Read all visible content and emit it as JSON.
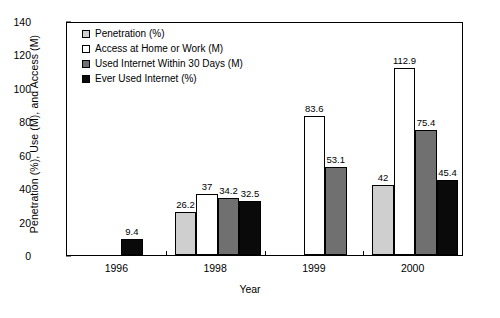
{
  "chart_data": {
    "type": "bar",
    "title": "",
    "xlabel": "Year",
    "ylabel": "Penetration (%), Use (M), and Access (M)",
    "categories": [
      "1996",
      "1998",
      "1999",
      "2000"
    ],
    "ylim": [
      0,
      140
    ],
    "yticks": [
      0,
      20,
      40,
      60,
      80,
      100,
      120,
      140
    ],
    "grid": false,
    "legend_position": "top-left",
    "series": [
      {
        "name": "Penetration (%)",
        "color": "#cfcfcf",
        "values": [
          null,
          26.2,
          null,
          42
        ],
        "labels": [
          "",
          "26.2",
          "",
          "42"
        ]
      },
      {
        "name": "Access at Home or Work (M)",
        "color": "#ffffff",
        "values": [
          null,
          37,
          83.6,
          112.9
        ],
        "labels": [
          "",
          "37",
          "83.6",
          "112.9"
        ]
      },
      {
        "name": "Used Internet Within 30 Days (M)",
        "color": "#707070",
        "values": [
          null,
          34.2,
          53.1,
          75.4
        ],
        "labels": [
          "",
          "34.2",
          "53.1",
          "75.4"
        ]
      },
      {
        "name": "Ever Used Internet (%)",
        "color": "#0a0a0a",
        "values": [
          9.4,
          32.5,
          null,
          45.4
        ],
        "labels": [
          "9.4",
          "32.5",
          "",
          "45.4"
        ]
      }
    ]
  }
}
